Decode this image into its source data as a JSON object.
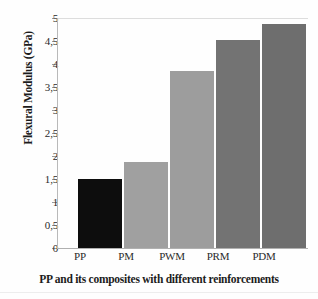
{
  "chart_data": {
    "type": "bar",
    "title": "",
    "xlabel": "PP and its composites with different reinforcements",
    "ylabel": "Flexural Modulus (GPa)",
    "categories": [
      "PP",
      "PM",
      "PWM",
      "PRM",
      "PDM"
    ],
    "values": [
      1.5,
      1.88,
      3.85,
      4.52,
      4.87
    ],
    "ylim": [
      0,
      5
    ],
    "ytick_values": [
      0,
      0.5,
      1,
      1.5,
      2,
      2.5,
      3,
      3.5,
      4,
      4.5,
      5
    ],
    "ytick_labels": [
      "0",
      "0,5",
      "1",
      "1,5",
      "2",
      "2,5",
      "3",
      "3,5",
      "4",
      "4,5",
      "5"
    ],
    "decimal_separator": ",",
    "grid": false,
    "legend": "none",
    "bar_colors": [
      "#0d0d0d",
      "#a0a0a0",
      "#9d9d9d",
      "#737373",
      "#6e6e6e"
    ],
    "series": [
      {
        "name": "Flexural Modulus (GPa)",
        "values": [
          1.5,
          1.88,
          3.85,
          4.52,
          4.87
        ]
      }
    ],
    "points": [
      {
        "category": "PP",
        "value": 1.5,
        "color": "#0d0d0d"
      },
      {
        "category": "PM",
        "value": 1.88,
        "color": "#a0a0a0"
      },
      {
        "category": "PWM",
        "value": 3.85,
        "color": "#9d9d9d"
      },
      {
        "category": "PRM",
        "value": 4.52,
        "color": "#737373"
      },
      {
        "category": "PDM",
        "value": 4.87,
        "color": "#6e6e6e"
      }
    ]
  },
  "axis": {
    "y_title": "Flexural Modulus (GPa)",
    "x_title": "PP and its composites with different reinforcements"
  },
  "ticks": {
    "t0": "0",
    "t1": "0,5",
    "t2": "1",
    "t3": "1,5",
    "t4": "2",
    "t5": "2,5",
    "t6": "3",
    "t7": "3,5",
    "t8": "4",
    "t9": "4,5",
    "t10": "5"
  },
  "categories": {
    "c0": "PP",
    "c1": "PM",
    "c2": "PWM",
    "c3": "PRM",
    "c4": "PDM"
  }
}
